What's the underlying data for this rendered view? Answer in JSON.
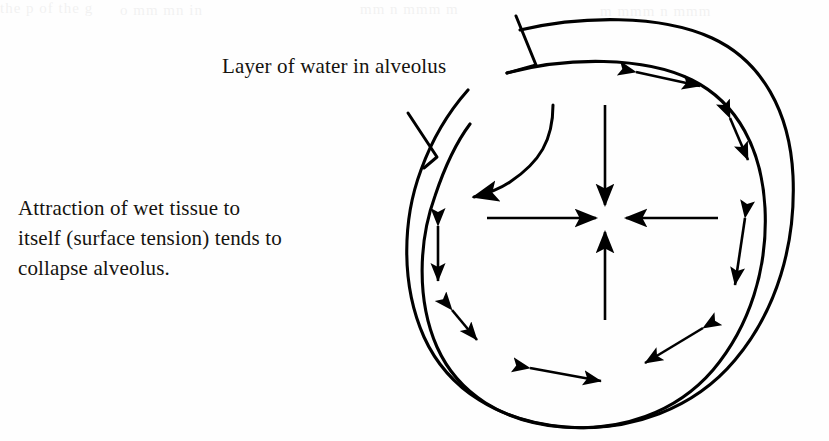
{
  "figure": {
    "type": "anatomical-diagram",
    "ink_color": "#15130f",
    "background_color": "#fefefe",
    "line_color": "#000000"
  },
  "labels": {
    "water_layer": {
      "text": "Layer of water in alveolus",
      "points_to": "inner-wall-top"
    },
    "attraction": {
      "line1": "Attraction of wet tissue to",
      "line2": "itself (surface tension) tends to",
      "line3": "collapse alveolus.",
      "points_to": "water-layer-left"
    }
  },
  "bleed_through": {
    "line_a": "the p of the g",
    "line_b": "o mm mn in",
    "line_c": "mm n mmm m",
    "line_d": "m mmm n mmm"
  },
  "diagram": {
    "alveolus_outer_wall_label": "alveolus outer wall",
    "alveolus_inner_wall_label": "water layer inner boundary",
    "center_label": "collapse point",
    "inward_arrows_count": 4,
    "tangential_arrows_count": 8,
    "inward_arrow_names": [
      "inward-arrow-top",
      "inward-arrow-bottom",
      "inward-arrow-left",
      "inward-arrow-right"
    ],
    "tangential_arrow_names": [
      "tension-arrow-top",
      "tension-arrow-upper-right",
      "tension-arrow-right",
      "tension-arrow-lower-right",
      "tension-arrow-bottom-right",
      "tension-arrow-bottom-center",
      "tension-arrow-bottom-left",
      "tension-arrow-left"
    ]
  }
}
